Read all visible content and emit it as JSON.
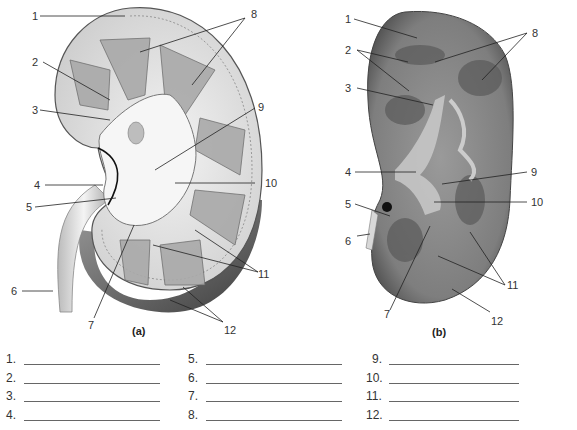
{
  "figure_a": {
    "caption": "(a)",
    "labels": [
      "1",
      "2",
      "3",
      "4",
      "5",
      "6",
      "7",
      "8",
      "9",
      "10",
      "11",
      "12"
    ]
  },
  "figure_b": {
    "caption": "(b)",
    "labels": [
      "1",
      "2",
      "3",
      "4",
      "5",
      "6",
      "7",
      "8",
      "9",
      "10",
      "11",
      "12"
    ]
  },
  "answers": [
    {
      "num": "1.",
      "value": ""
    },
    {
      "num": "2.",
      "value": ""
    },
    {
      "num": "3.",
      "value": ""
    },
    {
      "num": "4.",
      "value": ""
    },
    {
      "num": "5.",
      "value": ""
    },
    {
      "num": "6.",
      "value": ""
    },
    {
      "num": "7.",
      "value": ""
    },
    {
      "num": "8.",
      "value": ""
    },
    {
      "num": "9.",
      "value": ""
    },
    {
      "num": "10.",
      "value": ""
    },
    {
      "num": "11.",
      "value": ""
    },
    {
      "num": "12.",
      "value": ""
    }
  ]
}
